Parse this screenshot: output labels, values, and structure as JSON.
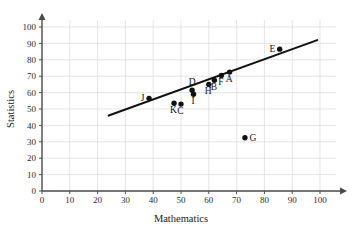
{
  "chart_data": {
    "type": "scatter",
    "title": "",
    "xlabel": "Mathematics",
    "ylabel": "Statistics",
    "xlim": [
      0,
      100
    ],
    "ylim": [
      0,
      100
    ],
    "xticks": [
      0,
      10,
      20,
      30,
      40,
      50,
      60,
      70,
      80,
      90,
      100
    ],
    "yticks": [
      0,
      10,
      20,
      30,
      40,
      50,
      60,
      70,
      80,
      90,
      100
    ],
    "grid": true,
    "legend": "none",
    "point_color": "#111111",
    "trendline_color": "#121212",
    "grid_color": "#d8d8d8",
    "axis_color": "#4a4a4a",
    "points": [
      {
        "label": "J",
        "x": 38.5,
        "y": 56.5,
        "label_side": "left"
      },
      {
        "label": "K",
        "x": 47.5,
        "y": 53.5,
        "label_side": "below"
      },
      {
        "label": "C",
        "x": 50.0,
        "y": 53.0,
        "label_side": "below"
      },
      {
        "label": "D",
        "x": 54.0,
        "y": 61.5,
        "label_side": "above"
      },
      {
        "label": "I",
        "x": 54.5,
        "y": 59.0,
        "label_side": "below"
      },
      {
        "label": "H",
        "x": 60.0,
        "y": 65.0,
        "label_side": "below"
      },
      {
        "label": "B",
        "x": 62.0,
        "y": 67.5,
        "label_side": "below"
      },
      {
        "label": "F",
        "x": 64.5,
        "y": 70.5,
        "label_side": "below"
      },
      {
        "label": "A",
        "x": 67.5,
        "y": 72.5,
        "label_side": "below"
      },
      {
        "label": "G",
        "x": 73.0,
        "y": 32.5,
        "label_side": "right"
      },
      {
        "label": "E",
        "x": 85.5,
        "y": 86.5,
        "label_side": "left"
      }
    ],
    "trendline": {
      "x1": 24,
      "y1": 46,
      "x2": 99,
      "y2": 92
    }
  }
}
